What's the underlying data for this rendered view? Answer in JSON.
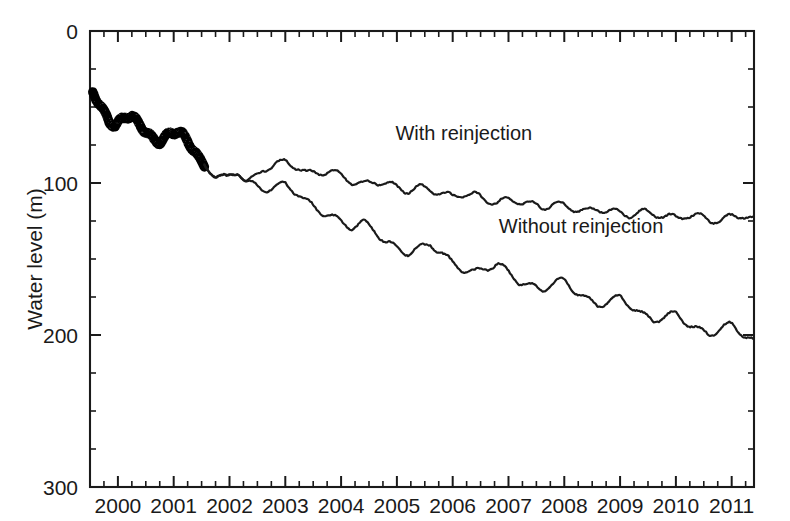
{
  "figure": {
    "background_color": "#ffffff",
    "ink_color": "#1a1a1a"
  },
  "chart_data": {
    "type": "line",
    "title": "",
    "subtitle": "",
    "xlabel": "",
    "ylabel": "Water level (m)",
    "xlim": [
      1999.5,
      2011.4
    ],
    "ylim": [
      300,
      0
    ],
    "y_axis_inverted": true,
    "grid": false,
    "legend_position": "inline-annotations",
    "x_tick_labels": [
      "2000",
      "2001",
      "2002",
      "2003",
      "2004",
      "2005",
      "2006",
      "2007",
      "2008",
      "2009",
      "2010",
      "2011"
    ],
    "x_tick_values": [
      2000,
      2001,
      2002,
      2003,
      2004,
      2005,
      2006,
      2007,
      2008,
      2009,
      2010,
      2011
    ],
    "x_minor_ticks_between_majors": 3,
    "y_tick_labels": [
      "0",
      "100",
      "200",
      "300"
    ],
    "y_tick_values": [
      0,
      100,
      200,
      300
    ],
    "y_minor_ticks_between_majors": 3,
    "annotations": [
      {
        "text": "With reinjection",
        "x": 2006.2,
        "y": 72,
        "name": "with-reinjection-label"
      },
      {
        "text": "Without reinjection",
        "x": 2008.3,
        "y": 133,
        "name": "without-reinjection-label"
      }
    ],
    "series": [
      {
        "name": "Observed (measured) water level",
        "style": "thick-black",
        "x": [
          1999.55,
          1999.7,
          1999.85,
          1999.95,
          2000.05,
          2000.15,
          2000.25,
          2000.35,
          2000.45,
          2000.55,
          2000.65,
          2000.75,
          2000.85,
          2000.95,
          2001.05,
          2001.15,
          2001.25,
          2001.35,
          2001.45,
          2001.55
        ],
        "values": [
          40,
          50,
          60,
          62,
          59,
          56,
          56,
          60,
          64,
          68,
          72,
          73,
          70,
          67,
          66,
          68,
          72,
          78,
          84,
          88
        ]
      },
      {
        "name": "With reinjection",
        "style": "thin-black",
        "x": [
          2001.55,
          2001.75,
          2001.95,
          2002.15,
          2002.3,
          2002.45,
          2002.6,
          2002.8,
          2003.0,
          2003.2,
          2003.4,
          2003.6,
          2003.8,
          2004.0,
          2004.2,
          2004.4,
          2004.6,
          2004.8,
          2005.0,
          2005.2,
          2005.4,
          2005.6,
          2005.8,
          2006.0,
          2006.2,
          2006.4,
          2006.6,
          2006.8,
          2007.0,
          2007.2,
          2007.4,
          2007.6,
          2007.8,
          2008.0,
          2008.2,
          2008.4,
          2008.6,
          2008.8,
          2009.0,
          2009.2,
          2009.4,
          2009.6,
          2009.8,
          2010.0,
          2010.2,
          2010.4,
          2010.6,
          2010.8,
          2011.0,
          2011.2,
          2011.38
        ],
        "values": [
          88,
          95,
          97,
          92,
          99,
          97,
          91,
          88,
          86,
          89,
          94,
          93,
          92,
          95,
          99,
          101,
          99,
          100,
          103,
          105,
          103,
          104,
          107,
          109,
          107,
          108,
          111,
          113,
          111,
          112,
          114,
          116,
          114,
          115,
          117,
          119,
          117,
          118,
          120,
          121,
          119,
          120,
          122,
          123,
          121,
          122,
          124,
          125,
          122,
          121,
          124
        ]
      },
      {
        "name": "Without reinjection",
        "style": "thin-black",
        "x": [
          2001.55,
          2001.75,
          2001.95,
          2002.15,
          2002.3,
          2002.45,
          2002.6,
          2002.8,
          2003.0,
          2003.2,
          2003.4,
          2003.6,
          2003.8,
          2004.0,
          2004.2,
          2004.4,
          2004.6,
          2004.8,
          2005.0,
          2005.2,
          2005.4,
          2005.6,
          2005.8,
          2006.0,
          2006.2,
          2006.4,
          2006.6,
          2006.8,
          2007.0,
          2007.2,
          2007.4,
          2007.6,
          2007.8,
          2008.0,
          2008.2,
          2008.4,
          2008.6,
          2008.8,
          2009.0,
          2009.2,
          2009.4,
          2009.6,
          2009.8,
          2010.0,
          2010.2,
          2010.4,
          2010.6,
          2010.8,
          2011.0,
          2011.2,
          2011.38
        ],
        "values": [
          88,
          95,
          97,
          92,
          99,
          102,
          104,
          103,
          101,
          106,
          113,
          118,
          121,
          126,
          129,
          126,
          131,
          139,
          143,
          146,
          143,
          140,
          146,
          153,
          157,
          159,
          156,
          153,
          159,
          165,
          168,
          170,
          166,
          164,
          171,
          177,
          180,
          178,
          175,
          181,
          187,
          190,
          188,
          186,
          192,
          197,
          199,
          196,
          193,
          199,
          204
        ]
      }
    ]
  }
}
